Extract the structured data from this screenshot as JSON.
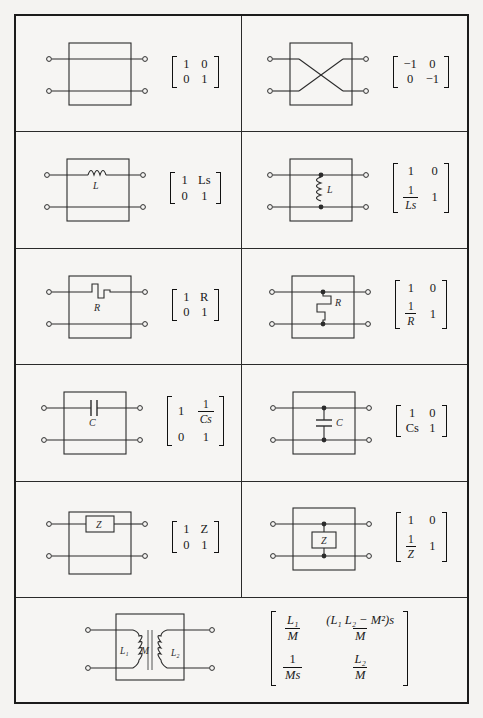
{
  "page": {
    "background_color": "#f4f3f1",
    "ink_color": "#1b1b1b"
  },
  "rows": [
    {
      "row_index": 1,
      "cells": [
        {
          "position": "left",
          "circuit": {
            "name": "direct-through-connection",
            "element_label": "",
            "terminals": 4,
            "topology": "series-through"
          },
          "matrix": {
            "a11": "1",
            "a12": "0",
            "a21": "0",
            "a22": "1",
            "style": "plain"
          }
        },
        {
          "position": "right",
          "circuit": {
            "name": "crossover-connection",
            "element_label": "",
            "terminals": 4,
            "topology": "crossed"
          },
          "matrix": {
            "a11": "−1",
            "a12": "0",
            "a21": "0",
            "a22": "−1",
            "style": "plain"
          }
        }
      ]
    },
    {
      "row_index": 2,
      "cells": [
        {
          "position": "left",
          "circuit": {
            "name": "series-inductor",
            "element_label": "L",
            "terminals": 4,
            "topology": "series"
          },
          "matrix": {
            "a11": "1",
            "a12": "Ls",
            "a21": "0",
            "a22": "1",
            "style": "plain"
          }
        },
        {
          "position": "right",
          "circuit": {
            "name": "shunt-inductor",
            "element_label": "L",
            "terminals": 4,
            "topology": "shunt"
          },
          "matrix": {
            "a11": "1",
            "a12": "0",
            "a21_num": "1",
            "a21_den": "Ls",
            "a22": "1",
            "style": "fraction-a21"
          }
        }
      ]
    },
    {
      "row_index": 3,
      "cells": [
        {
          "position": "left",
          "circuit": {
            "name": "series-resistor",
            "element_label": "R",
            "terminals": 4,
            "topology": "series"
          },
          "matrix": {
            "a11": "1",
            "a12": "R",
            "a21": "0",
            "a22": "1",
            "style": "plain"
          }
        },
        {
          "position": "right",
          "circuit": {
            "name": "shunt-resistor",
            "element_label": "R",
            "terminals": 4,
            "topology": "shunt"
          },
          "matrix": {
            "a11": "1",
            "a12": "0",
            "a21_num": "1",
            "a21_den": "R",
            "a22": "1",
            "style": "fraction-a21"
          }
        }
      ]
    },
    {
      "row_index": 4,
      "cells": [
        {
          "position": "left",
          "circuit": {
            "name": "series-capacitor",
            "element_label": "C",
            "terminals": 4,
            "topology": "series"
          },
          "matrix": {
            "a11": "1",
            "a12_num": "1",
            "a12_den": "Cs",
            "a21": "0",
            "a22": "1",
            "style": "fraction-a12"
          }
        },
        {
          "position": "right",
          "circuit": {
            "name": "shunt-capacitor",
            "element_label": "C",
            "terminals": 4,
            "topology": "shunt"
          },
          "matrix": {
            "a11": "1",
            "a12": "0",
            "a21": "Cs",
            "a22": "1",
            "style": "plain"
          }
        }
      ]
    },
    {
      "row_index": 5,
      "cells": [
        {
          "position": "left",
          "circuit": {
            "name": "series-impedance",
            "element_label": "Z",
            "terminals": 4,
            "topology": "series"
          },
          "matrix": {
            "a11": "1",
            "a12": "Z",
            "a21": "0",
            "a22": "1",
            "style": "plain"
          }
        },
        {
          "position": "right",
          "circuit": {
            "name": "shunt-impedance",
            "element_label": "Z",
            "terminals": 4,
            "topology": "shunt"
          },
          "matrix": {
            "a11": "1",
            "a12": "0",
            "a21_num": "1",
            "a21_den": "Z",
            "a22": "1",
            "style": "fraction-a21"
          }
        }
      ]
    },
    {
      "row_index": 6,
      "cells": [
        {
          "position": "full",
          "circuit": {
            "name": "mutually-coupled-transformer",
            "labels": {
              "primary": "L",
              "primary_sub": "1",
              "mutual": "M",
              "secondary": "L",
              "secondary_sub": "2"
            },
            "terminals": 4,
            "topology": "transformer"
          },
          "matrix": {
            "a11_num": "L₁",
            "a11_den": "M",
            "a12_num": "(L₁ L₂ − M²)s",
            "a12_den": "M",
            "a21_num": "1",
            "a21_den": "Ms",
            "a22_num": "L₂",
            "a22_den": "M",
            "style": "all-fractions"
          }
        }
      ]
    }
  ],
  "matrix_text": {
    "r1c1": "[1 0; 0 1]",
    "r1c2": "[-1 0; 0 -1]",
    "r2c1": "[1 Ls; 0 1]",
    "r2c2": "[1 0; 1/Ls 1]",
    "r3c1": "[1 R; 0 1]",
    "r3c2": "[1 0; 1/R 1]",
    "r4c1": "[1 1/Cs; 0 1]",
    "r4c2": "[1 0; Cs 1]",
    "r5c1": "[1 Z; 0 1]",
    "r5c2": "[1 0; 1/Z 1]",
    "r6": "[L1/M (L1L2-M^2)s/M; 1/Ms L2/M]"
  }
}
